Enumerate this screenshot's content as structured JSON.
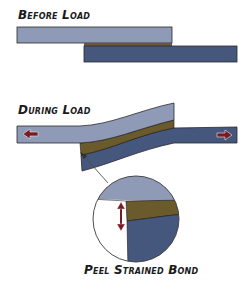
{
  "labels": {
    "before": "Before Load",
    "during": "During Load",
    "peel": "Peel Strained Bond"
  },
  "colors": {
    "top_adherend": "#8f9ab6",
    "bottom_adherend": "#46577d",
    "adhesive": "#6b5a2c",
    "outline": "#2a2a2a",
    "force_arrow": "#7a1b22",
    "background": "#ffffff"
  },
  "icons": {
    "left_force": "left-pull-arrow",
    "right_force": "right-pull-arrow",
    "peel_strain": "double-headed-vertical-arrow"
  }
}
